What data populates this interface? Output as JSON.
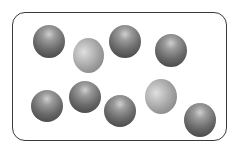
{
  "diagram": {
    "type": "particle-model",
    "container": {
      "shape": "rounded-rectangle",
      "x": 12,
      "y": 12,
      "width": 217,
      "height": 131,
      "border_color": "#3a3a3a"
    },
    "colors": {
      "dark_particle": "#555555",
      "light_particle": "#a0a0a0"
    },
    "particles": [
      {
        "id": 1,
        "kind": "dark",
        "cx": 49,
        "cy": 41,
        "w": 32,
        "h": 33
      },
      {
        "id": 2,
        "kind": "light",
        "cx": 88,
        "cy": 55,
        "w": 31,
        "h": 35
      },
      {
        "id": 3,
        "kind": "dark",
        "cx": 125,
        "cy": 41,
        "w": 32,
        "h": 33
      },
      {
        "id": 4,
        "kind": "dark",
        "cx": 171,
        "cy": 50,
        "w": 32,
        "h": 33
      },
      {
        "id": 5,
        "kind": "dark",
        "cx": 47,
        "cy": 106,
        "w": 32,
        "h": 32
      },
      {
        "id": 6,
        "kind": "dark",
        "cx": 85,
        "cy": 97,
        "w": 32,
        "h": 32
      },
      {
        "id": 7,
        "kind": "dark",
        "cx": 120,
        "cy": 111,
        "w": 32,
        "h": 32
      },
      {
        "id": 8,
        "kind": "light",
        "cx": 161,
        "cy": 96,
        "w": 32,
        "h": 35
      },
      {
        "id": 9,
        "kind": "dark",
        "cx": 200,
        "cy": 120,
        "w": 32,
        "h": 34
      }
    ],
    "counts": {
      "dark": 7,
      "light": 2,
      "total": 9
    }
  }
}
